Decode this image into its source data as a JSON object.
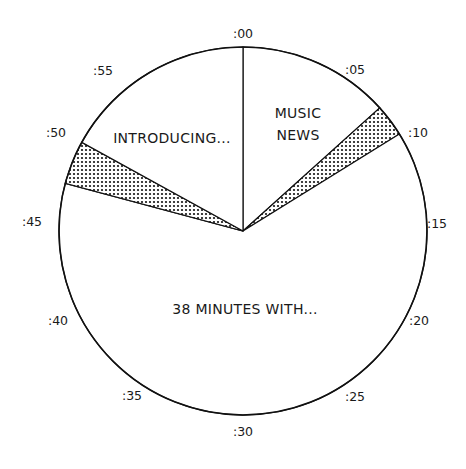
{
  "chart_data": {
    "type": "pie",
    "title": "",
    "subtitle": "",
    "start_angle": "top (:00), clockwise",
    "total_minutes": 60,
    "slices": [
      {
        "label": "MUSIC NEWS",
        "start_min": 0,
        "end_min": 8,
        "minutes": 8,
        "fill": "white"
      },
      {
        "label": "",
        "start_min": 8,
        "end_min": 9.7,
        "minutes": 1.7,
        "fill": "dotted"
      },
      {
        "label": "38 MINUTES WITH...",
        "start_min": 9.7,
        "end_min": 47.5,
        "minutes": 37.8,
        "fill": "white"
      },
      {
        "label": "",
        "start_min": 47.5,
        "end_min": 49.8,
        "minutes": 2.3,
        "fill": "dotted"
      },
      {
        "label": "INTRODUCING...",
        "start_min": 49.8,
        "end_min": 60,
        "minutes": 10.2,
        "fill": "white"
      }
    ],
    "tick_labels": [
      ":00",
      ":05",
      ":10",
      ":15",
      ":20",
      ":25",
      ":30",
      ":35",
      ":40",
      ":45",
      ":50",
      ":55"
    ],
    "legend": null,
    "grid": false
  },
  "ticks": [
    {
      "text": ":00",
      "x": 243,
      "y": 38
    },
    {
      "text": ":05",
      "x": 355,
      "y": 74
    },
    {
      "text": ":10",
      "x": 418,
      "y": 137
    },
    {
      "text": ":15",
      "x": 437,
      "y": 228
    },
    {
      "text": ":20",
      "x": 419,
      "y": 325
    },
    {
      "text": ":25",
      "x": 355,
      "y": 401
    },
    {
      "text": ":30",
      "x": 243,
      "y": 436
    },
    {
      "text": ":35",
      "x": 132,
      "y": 400
    },
    {
      "text": ":40",
      "x": 58,
      "y": 325
    },
    {
      "text": ":45",
      "x": 32,
      "y": 226
    },
    {
      "text": ":50",
      "x": 56,
      "y": 137
    },
    {
      "text": ":55",
      "x": 103,
      "y": 75
    }
  ],
  "labels": {
    "music_news_line1": "MUSIC",
    "music_news_line2": "NEWS",
    "introducing": "INTRODUCING...",
    "minutes_with": "38 MINUTES WITH..."
  }
}
